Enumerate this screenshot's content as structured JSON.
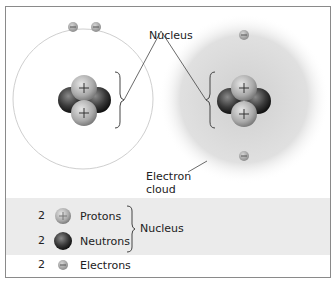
{
  "diagram": {
    "title_labels": {
      "nucleus": "Nucleus",
      "electron_cloud_line1": "Electron",
      "electron_cloud_line2": "cloud"
    },
    "left_model": {
      "type": "orbital",
      "electrons": 2,
      "protons": 2,
      "neutrons": 2
    },
    "right_model": {
      "type": "electron-cloud",
      "electrons": 2,
      "protons": 2,
      "neutrons": 2
    }
  },
  "legend": {
    "items": [
      {
        "count": "2",
        "label": "Protons",
        "symbol": "proton-icon"
      },
      {
        "count": "2",
        "label": "Neutrons",
        "symbol": "neutron-icon"
      },
      {
        "count": "2",
        "label": "Electrons",
        "symbol": "electron-icon"
      }
    ],
    "group_label": "Nucleus"
  },
  "colors": {
    "proton": "#b0b0b0",
    "neutron": "#3a3a3a",
    "electron": "#a8a8a8",
    "cloud": "#d8d8d8",
    "legend_band": "#ebebeb"
  }
}
